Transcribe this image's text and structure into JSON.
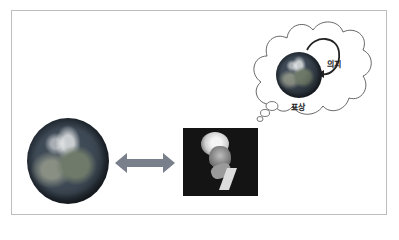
{
  "diagram": {
    "left_image": {
      "name": "earth-globe"
    },
    "connector": {
      "type": "double-headed-arrow",
      "color": "#7a7f8c"
    },
    "center_image": {
      "name": "philosopher-portrait"
    },
    "thought_bubble": {
      "globe": {
        "name": "earth-globe-small"
      },
      "labels": {
        "will": "의지",
        "representation": "표상"
      },
      "loop_arrow": {
        "direction": "clockwise-into-globe"
      }
    }
  }
}
